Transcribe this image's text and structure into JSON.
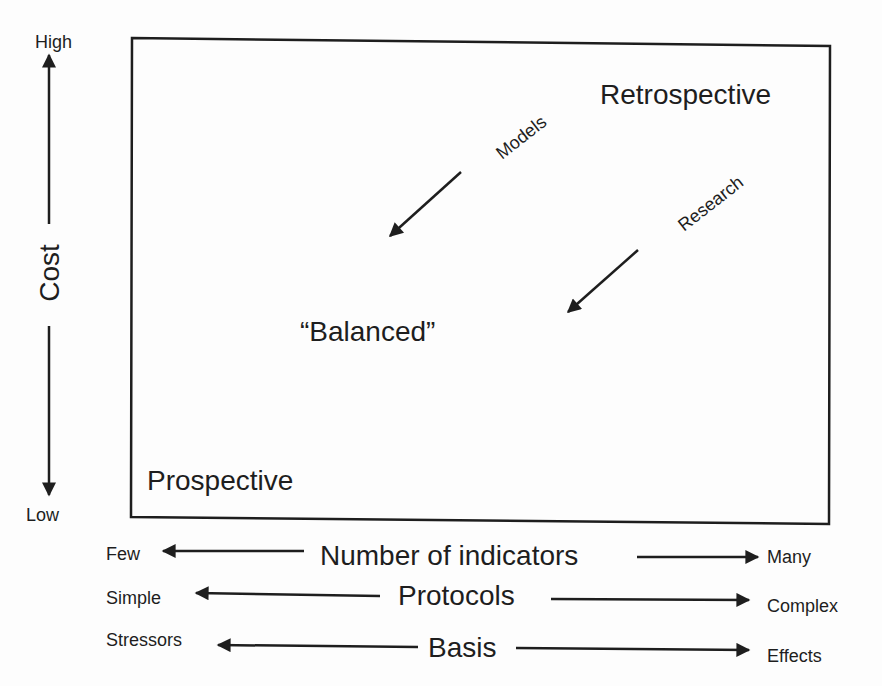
{
  "diagram": {
    "y_axis": {
      "label": "Cost",
      "high_label": "High",
      "low_label": "Low"
    },
    "quadrant_labels": {
      "top_right": "Retrospective",
      "center": "“Balanced”",
      "bottom_left": "Prospective"
    },
    "arrows": [
      {
        "label": "Models",
        "direction": "toward balanced"
      },
      {
        "label": "Research",
        "direction": "toward balanced"
      }
    ],
    "x_axes": [
      {
        "label": "Number of indicators",
        "left": "Few",
        "right": "Many"
      },
      {
        "label": "Protocols",
        "left": "Simple",
        "right": "Complex"
      },
      {
        "label": "Basis",
        "left": "Stressors",
        "right": "Effects"
      }
    ],
    "colors": {
      "ink": "#1e1e1e",
      "background": "#fdfdfd"
    }
  }
}
